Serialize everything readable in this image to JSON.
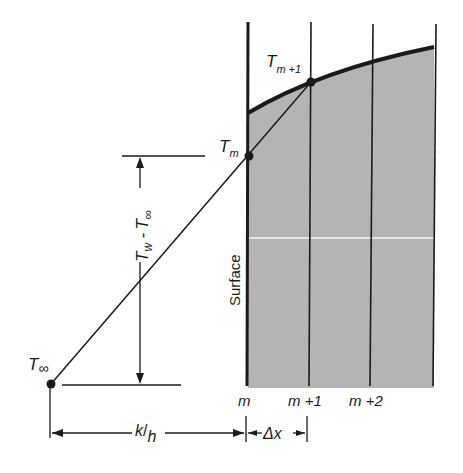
{
  "diagram": {
    "colors": {
      "ink": "#1a1a1a",
      "shade": "#b4b4b4",
      "background": "#ffffff"
    },
    "labels": {
      "t_m_plus_1": {
        "base": "T",
        "sub": "m +1"
      },
      "t_m": {
        "base": "T",
        "sub": "m"
      },
      "t_inf": {
        "base": "T",
        "sub": "∞"
      },
      "temp_diff": {
        "a": "T",
        "a_sub": "w",
        "mid": " -",
        "b": "T",
        "b_sub": "∞"
      },
      "surface": "Surface",
      "node_m": "m",
      "node_m1": "m +1",
      "node_m2": "m +2",
      "k_over_h": {
        "num": "k",
        "sep": "/",
        "den": "h"
      },
      "delta_x": "Δx"
    }
  }
}
